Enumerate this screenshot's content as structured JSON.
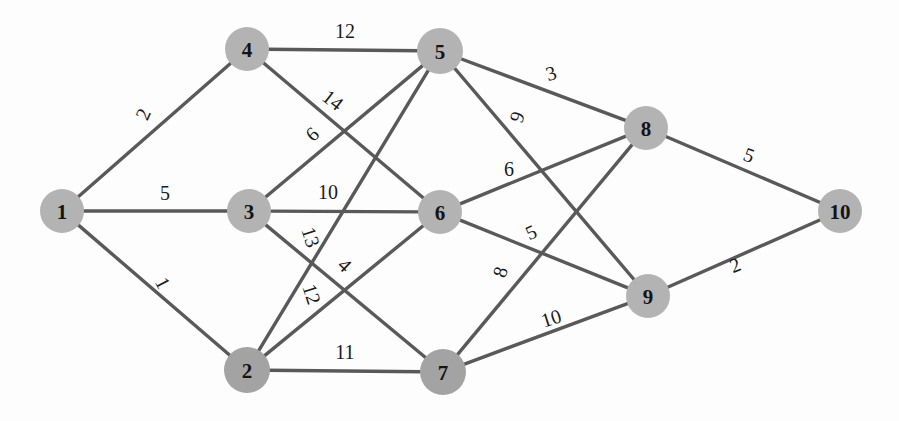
{
  "diagram": {
    "type": "node-link-graph",
    "background_color": "#fdfdfd",
    "node_fill": "#b3b3b3",
    "node_dark_fill": "#a3a3a3",
    "edge_color": "#595959",
    "label_color": "#141414"
  },
  "nodes": [
    {
      "id": "1",
      "label": "1",
      "x": 62,
      "y": 211,
      "r": 22,
      "shade": "normal"
    },
    {
      "id": "2",
      "label": "2",
      "x": 247,
      "y": 370,
      "r": 23,
      "shade": "dark"
    },
    {
      "id": "3",
      "label": "3",
      "x": 249,
      "y": 211,
      "r": 22,
      "shade": "normal"
    },
    {
      "id": "4",
      "label": "4",
      "x": 247,
      "y": 49,
      "r": 22,
      "shade": "normal"
    },
    {
      "id": "5",
      "label": "5",
      "x": 440,
      "y": 51,
      "r": 23,
      "shade": "normal"
    },
    {
      "id": "6",
      "label": "6",
      "x": 440,
      "y": 212,
      "r": 22,
      "shade": "normal"
    },
    {
      "id": "7",
      "label": "7",
      "x": 443,
      "y": 372,
      "r": 23,
      "shade": "dark"
    },
    {
      "id": "8",
      "label": "8",
      "x": 646,
      "y": 128,
      "r": 22,
      "shade": "normal"
    },
    {
      "id": "9",
      "label": "9",
      "x": 648,
      "y": 296,
      "r": 22,
      "shade": "normal"
    },
    {
      "id": "10",
      "label": "10",
      "x": 840,
      "y": 211,
      "r": 22,
      "shade": "normal"
    }
  ],
  "edges": [
    {
      "source": "1",
      "target": "4",
      "weight": "2",
      "lx": 143,
      "ly": 114,
      "rot": -66
    },
    {
      "source": "1",
      "target": "3",
      "weight": "5",
      "lx": 165,
      "ly": 193,
      "rot": 0
    },
    {
      "source": "1",
      "target": "2",
      "weight": "1",
      "lx": 163,
      "ly": 283,
      "rot": 62
    },
    {
      "source": "4",
      "target": "5",
      "weight": "12",
      "lx": 345,
      "ly": 31,
      "rot": 0
    },
    {
      "source": "4",
      "target": "6",
      "weight": "14",
      "lx": 333,
      "ly": 100,
      "rot": 38
    },
    {
      "source": "3",
      "target": "5",
      "weight": "6",
      "lx": 312,
      "ly": 134,
      "rot": -42
    },
    {
      "source": "3",
      "target": "6",
      "weight": "10",
      "lx": 328,
      "ly": 192,
      "rot": 0
    },
    {
      "source": "3",
      "target": "7",
      "weight": "13",
      "lx": 311,
      "ly": 237,
      "rot": 72
    },
    {
      "source": "2",
      "target": "5",
      "weight": "12",
      "lx": 312,
      "ly": 294,
      "rot": 72
    },
    {
      "source": "2",
      "target": "6",
      "weight": "4",
      "lx": 345,
      "ly": 265,
      "rot": 44
    },
    {
      "source": "2",
      "target": "7",
      "weight": "11",
      "lx": 345,
      "ly": 352,
      "rot": 0
    },
    {
      "source": "5",
      "target": "8",
      "weight": "3",
      "lx": 551,
      "ly": 73,
      "rot": -17
    },
    {
      "source": "5",
      "target": "9",
      "weight": "9",
      "lx": 517,
      "ly": 117,
      "rot": -70
    },
    {
      "source": "6",
      "target": "8",
      "weight": "6",
      "lx": 509,
      "ly": 169,
      "rot": 0
    },
    {
      "source": "6",
      "target": "9",
      "weight": "5",
      "lx": 531,
      "ly": 232,
      "rot": -24
    },
    {
      "source": "7",
      "target": "8",
      "weight": "8",
      "lx": 500,
      "ly": 272,
      "rot": -73
    },
    {
      "source": "7",
      "target": "9",
      "weight": "10",
      "lx": 551,
      "ly": 318,
      "rot": -18
    },
    {
      "source": "8",
      "target": "10",
      "weight": "5",
      "lx": 749,
      "ly": 155,
      "rot": 20
    },
    {
      "source": "9",
      "target": "10",
      "weight": "2",
      "lx": 735,
      "ly": 265,
      "rot": -22
    }
  ]
}
